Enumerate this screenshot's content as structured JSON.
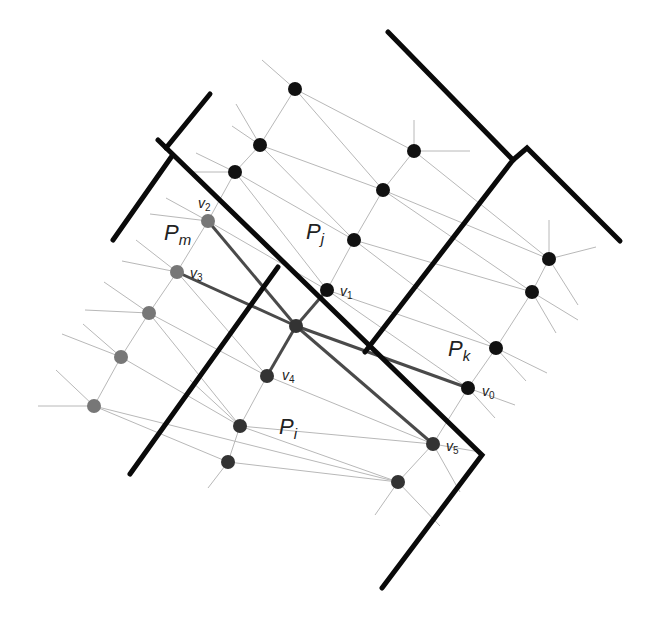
{
  "colors": {
    "background": "#ffffff",
    "boundary": "#0a0a0a",
    "thin_edge": "#b8b8b8",
    "path_edge": "#4a4a4a",
    "node_black": "#111111",
    "node_dark": "#333333",
    "node_gray": "#777777"
  },
  "boundaries": [
    {
      "id": "b1",
      "points": [
        [
          388,
          32
        ],
        [
          513,
          160
        ]
      ]
    },
    {
      "id": "b2",
      "points": [
        [
          513,
          160
        ],
        [
          527,
          148
        ],
        [
          620,
          241
        ]
      ]
    },
    {
      "id": "b3",
      "points": [
        [
          158,
          140
        ],
        [
          482,
          455
        ],
        [
          382,
          588
        ]
      ]
    },
    {
      "id": "b4",
      "points": [
        [
          166,
          148
        ],
        [
          210,
          94
        ]
      ]
    },
    {
      "id": "b5",
      "points": [
        [
          172,
          156
        ],
        [
          113,
          240
        ]
      ]
    },
    {
      "id": "b6",
      "points": [
        [
          278,
          267
        ],
        [
          130,
          474
        ]
      ]
    },
    {
      "id": "b7",
      "points": [
        [
          513,
          160
        ],
        [
          365,
          352
        ]
      ]
    }
  ],
  "nodes": [
    {
      "id": "j1",
      "x": 295,
      "y": 89,
      "color": "node_black",
      "r": 7
    },
    {
      "id": "j2",
      "x": 260,
      "y": 145,
      "color": "node_black",
      "r": 7
    },
    {
      "id": "j3",
      "x": 235,
      "y": 172,
      "color": "node_black",
      "r": 7
    },
    {
      "id": "j4",
      "x": 414,
      "y": 151,
      "color": "node_black",
      "r": 7
    },
    {
      "id": "j5",
      "x": 383,
      "y": 190,
      "color": "node_black",
      "r": 7
    },
    {
      "id": "j6",
      "x": 354,
      "y": 240,
      "color": "node_black",
      "r": 7
    },
    {
      "id": "v1",
      "x": 327,
      "y": 290,
      "color": "node_black",
      "r": 7
    },
    {
      "id": "k1",
      "x": 549,
      "y": 259,
      "color": "node_black",
      "r": 7
    },
    {
      "id": "k2",
      "x": 532,
      "y": 292,
      "color": "node_black",
      "r": 7
    },
    {
      "id": "k3",
      "x": 496,
      "y": 348,
      "color": "node_black",
      "r": 7
    },
    {
      "id": "v0",
      "x": 468,
      "y": 388,
      "color": "node_black",
      "r": 7
    },
    {
      "id": "v2",
      "x": 208,
      "y": 221,
      "color": "node_gray",
      "r": 7
    },
    {
      "id": "v3",
      "x": 177,
      "y": 272,
      "color": "node_gray",
      "r": 7
    },
    {
      "id": "m1",
      "x": 149,
      "y": 313,
      "color": "node_gray",
      "r": 7
    },
    {
      "id": "m2",
      "x": 121,
      "y": 357,
      "color": "node_gray",
      "r": 7
    },
    {
      "id": "m3",
      "x": 94,
      "y": 406,
      "color": "node_gray",
      "r": 7
    },
    {
      "id": "c",
      "x": 296,
      "y": 326,
      "color": "node_dark",
      "r": 7
    },
    {
      "id": "v4",
      "x": 267,
      "y": 376,
      "color": "node_dark",
      "r": 7
    },
    {
      "id": "i1",
      "x": 240,
      "y": 426,
      "color": "node_dark",
      "r": 7
    },
    {
      "id": "i2",
      "x": 228,
      "y": 462,
      "color": "node_dark",
      "r": 7
    },
    {
      "id": "v5",
      "x": 433,
      "y": 444,
      "color": "node_dark",
      "r": 7
    },
    {
      "id": "i3",
      "x": 398,
      "y": 482,
      "color": "node_dark",
      "r": 7
    }
  ],
  "path_edges": [
    [
      "v2",
      "c"
    ],
    [
      "c",
      "v5"
    ],
    [
      "v3",
      "c"
    ],
    [
      "c",
      "v0"
    ],
    [
      "c",
      "v1"
    ],
    [
      "c",
      "v4"
    ]
  ],
  "thin_edges": [
    [
      "j1",
      "j2"
    ],
    [
      "j2",
      "j3"
    ],
    [
      "j3",
      "v2"
    ],
    [
      "j4",
      "j5"
    ],
    [
      "j5",
      "j6"
    ],
    [
      "j6",
      "v1"
    ],
    [
      "j1",
      "j4"
    ],
    [
      "j1",
      "j5"
    ],
    [
      "j2",
      "j5"
    ],
    [
      "j2",
      "j6"
    ],
    [
      "j3",
      "j6"
    ],
    [
      "j3",
      "v1"
    ],
    [
      "j4",
      "k1"
    ],
    [
      "j5",
      "k1"
    ],
    [
      "j5",
      "k2"
    ],
    [
      "j6",
      "k2"
    ],
    [
      "j6",
      "k3"
    ],
    [
      "v1",
      "k3"
    ],
    [
      "v1",
      "v0"
    ],
    [
      "k1",
      "k2"
    ],
    [
      "k2",
      "k3"
    ],
    [
      "k3",
      "v0"
    ],
    [
      "v2",
      "v3"
    ],
    [
      "v3",
      "m1"
    ],
    [
      "m1",
      "m2"
    ],
    [
      "m2",
      "m3"
    ],
    [
      "v2",
      "v1"
    ],
    [
      "v3",
      "v4"
    ],
    [
      "m1",
      "i1"
    ],
    [
      "m1",
      "v4"
    ],
    [
      "m2",
      "i1"
    ],
    [
      "m3",
      "i2"
    ],
    [
      "m3",
      "i3"
    ],
    [
      "v4",
      "i1"
    ],
    [
      "i1",
      "i2"
    ],
    [
      "v4",
      "v5"
    ],
    [
      "i1",
      "v5"
    ],
    [
      "i1",
      "i3"
    ],
    [
      "i2",
      "i3"
    ],
    [
      "v5",
      "i3"
    ],
    [
      "v0",
      "v5"
    ]
  ],
  "stubs": [
    [
      [
        295,
        89
      ],
      [
        262,
        60
      ]
    ],
    [
      [
        260,
        145
      ],
      [
        236,
        104
      ]
    ],
    [
      [
        260,
        145
      ],
      [
        232,
        126
      ]
    ],
    [
      [
        235,
        172
      ],
      [
        189,
        172
      ]
    ],
    [
      [
        235,
        172
      ],
      [
        196,
        153
      ]
    ],
    [
      [
        414,
        151
      ],
      [
        414,
        120
      ]
    ],
    [
      [
        414,
        151
      ],
      [
        470,
        151
      ]
    ],
    [
      [
        549,
        259
      ],
      [
        549,
        220
      ]
    ],
    [
      [
        549,
        259
      ],
      [
        596,
        247
      ]
    ],
    [
      [
        549,
        259
      ],
      [
        578,
        305
      ]
    ],
    [
      [
        532,
        292
      ],
      [
        578,
        320
      ]
    ],
    [
      [
        532,
        292
      ],
      [
        556,
        333
      ]
    ],
    [
      [
        496,
        348
      ],
      [
        526,
        381
      ]
    ],
    [
      [
        496,
        348
      ],
      [
        547,
        373
      ]
    ],
    [
      [
        468,
        388
      ],
      [
        495,
        418
      ]
    ],
    [
      [
        468,
        388
      ],
      [
        515,
        405
      ]
    ],
    [
      [
        208,
        221
      ],
      [
        150,
        214
      ]
    ],
    [
      [
        208,
        221
      ],
      [
        166,
        198
      ]
    ],
    [
      [
        177,
        272
      ],
      [
        122,
        261
      ]
    ],
    [
      [
        177,
        272
      ],
      [
        136,
        240
      ]
    ],
    [
      [
        149,
        313
      ],
      [
        85,
        310
      ]
    ],
    [
      [
        149,
        313
      ],
      [
        104,
        282
      ]
    ],
    [
      [
        121,
        357
      ],
      [
        62,
        334
      ]
    ],
    [
      [
        121,
        357
      ],
      [
        83,
        324
      ]
    ],
    [
      [
        94,
        406
      ],
      [
        38,
        406
      ]
    ],
    [
      [
        94,
        406
      ],
      [
        56,
        370
      ]
    ],
    [
      [
        228,
        462
      ],
      [
        208,
        488
      ]
    ],
    [
      [
        240,
        426
      ],
      [
        190,
        380
      ]
    ],
    [
      [
        433,
        444
      ],
      [
        460,
        492
      ]
    ],
    [
      [
        433,
        444
      ],
      [
        480,
        452
      ]
    ],
    [
      [
        398,
        482
      ],
      [
        375,
        515
      ]
    ],
    [
      [
        398,
        482
      ],
      [
        440,
        526
      ]
    ]
  ],
  "region_labels": [
    {
      "id": "Pm",
      "base": "P",
      "sub": "m",
      "x": 164,
      "y": 222
    },
    {
      "id": "Pj",
      "base": "P",
      "sub": "j",
      "x": 306,
      "y": 221
    },
    {
      "id": "Pk",
      "base": "P",
      "sub": "k",
      "x": 448,
      "y": 338
    },
    {
      "id": "Pi",
      "base": "P",
      "sub": "i",
      "x": 279,
      "y": 416
    }
  ],
  "vertex_labels": [
    {
      "id": "v0",
      "base": "v",
      "sub": "0",
      "x": 482,
      "y": 384
    },
    {
      "id": "v1",
      "base": "v",
      "sub": "1",
      "x": 340,
      "y": 284
    },
    {
      "id": "v2",
      "base": "v",
      "sub": "2",
      "x": 198,
      "y": 196
    },
    {
      "id": "v3",
      "base": "v",
      "sub": "3",
      "x": 190,
      "y": 266
    },
    {
      "id": "v4",
      "base": "v",
      "sub": "4",
      "x": 282,
      "y": 368
    },
    {
      "id": "v5",
      "base": "v",
      "sub": "5",
      "x": 446,
      "y": 439
    }
  ]
}
